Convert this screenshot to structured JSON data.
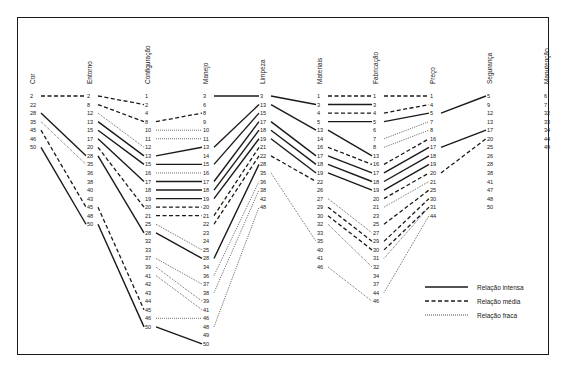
{
  "columns": [
    {
      "name": "Cor",
      "values": [
        "2",
        "22",
        "28",
        "35",
        "45",
        "46",
        "50"
      ]
    },
    {
      "name": "Entorno",
      "values": [
        "2",
        "8",
        "12",
        "13",
        "15",
        "17",
        "20",
        "28",
        "35",
        "36",
        "38",
        "40",
        "43",
        "45",
        "48",
        "50"
      ]
    },
    {
      "name": "Configuração",
      "values": [
        "1",
        "2",
        "4",
        "8",
        "10",
        "11",
        "12",
        "13",
        "15",
        "16",
        "17",
        "18",
        "19",
        "20",
        "21",
        "25",
        "28",
        "32",
        "33",
        "37",
        "39",
        "41",
        "42",
        "43",
        "44",
        "45",
        "46",
        "50"
      ]
    },
    {
      "name": "Manejo",
      "values": [
        "3",
        "6",
        "8",
        "9",
        "10",
        "11",
        "13",
        "14",
        "15",
        "16",
        "17",
        "18",
        "19",
        "20",
        "21",
        "22",
        "23",
        "24",
        "25",
        "28",
        "34",
        "36",
        "37",
        "38",
        "39",
        "41",
        "46",
        "48",
        "49",
        "50"
      ]
    },
    {
      "name": "Limpeza",
      "values": [
        "3",
        "13",
        "15",
        "17",
        "18",
        "19",
        "21",
        "22",
        "28",
        "35",
        "36",
        "38",
        "42",
        "48"
      ]
    },
    {
      "name": "Materiais",
      "values": [
        "1",
        "3",
        "4",
        "5",
        "13",
        "14",
        "16",
        "17",
        "18",
        "19",
        "22",
        "26",
        "27",
        "29",
        "30",
        "32",
        "33",
        "35",
        "40",
        "41",
        "46"
      ]
    },
    {
      "name": "Fabricação",
      "values": [
        "1",
        "3",
        "4",
        "5",
        "6",
        "7",
        "8",
        "13",
        "16",
        "17",
        "18",
        "19",
        "20",
        "21",
        "23",
        "25",
        "27",
        "29",
        "30",
        "31",
        "32",
        "34",
        "37",
        "44",
        "46"
      ]
    },
    {
      "name": "Preço",
      "values": [
        "1",
        "4",
        "5",
        "7",
        "8",
        "16",
        "17",
        "18",
        "19",
        "20",
        "21",
        "25",
        "30",
        "31",
        "44"
      ]
    },
    {
      "name": "Segurança",
      "values": [
        "5",
        "9",
        "12",
        "13",
        "17",
        "20",
        "25",
        "26",
        "28",
        "38",
        "41",
        "47",
        "48",
        "50"
      ]
    },
    {
      "name": "Manutenção",
      "values": [
        "6",
        "7",
        "32",
        "33",
        "34",
        "44",
        "49"
      ]
    }
  ],
  "links": [
    {
      "from": [
        0,
        "2"
      ],
      "to": [
        1,
        "2"
      ],
      "type": "medium"
    },
    {
      "from": [
        0,
        "28"
      ],
      "to": [
        1,
        "28"
      ],
      "type": "strong"
    },
    {
      "from": [
        0,
        "35"
      ],
      "to": [
        1,
        "35"
      ],
      "type": "weak"
    },
    {
      "from": [
        0,
        "45"
      ],
      "to": [
        1,
        "45"
      ],
      "type": "medium"
    },
    {
      "from": [
        0,
        "50"
      ],
      "to": [
        1,
        "50"
      ],
      "type": "strong"
    },
    {
      "from": [
        1,
        "2"
      ],
      "to": [
        2,
        "2"
      ],
      "type": "medium"
    },
    {
      "from": [
        1,
        "8"
      ],
      "to": [
        2,
        "8"
      ],
      "type": "medium"
    },
    {
      "from": [
        1,
        "12"
      ],
      "to": [
        2,
        "12"
      ],
      "type": "weak"
    },
    {
      "from": [
        1,
        "13"
      ],
      "to": [
        2,
        "13"
      ],
      "type": "strong"
    },
    {
      "from": [
        1,
        "15"
      ],
      "to": [
        2,
        "15"
      ],
      "type": "strong"
    },
    {
      "from": [
        1,
        "17"
      ],
      "to": [
        2,
        "17"
      ],
      "type": "strong"
    },
    {
      "from": [
        1,
        "20"
      ],
      "to": [
        2,
        "20"
      ],
      "type": "medium"
    },
    {
      "from": [
        1,
        "28"
      ],
      "to": [
        2,
        "28"
      ],
      "type": "strong"
    },
    {
      "from": [
        1,
        "45"
      ],
      "to": [
        2,
        "45"
      ],
      "type": "medium"
    },
    {
      "from": [
        1,
        "50"
      ],
      "to": [
        2,
        "50"
      ],
      "type": "strong"
    },
    {
      "from": [
        2,
        "8"
      ],
      "to": [
        3,
        "8"
      ],
      "type": "medium"
    },
    {
      "from": [
        2,
        "10"
      ],
      "to": [
        3,
        "10"
      ],
      "type": "weak"
    },
    {
      "from": [
        2,
        "11"
      ],
      "to": [
        3,
        "11"
      ],
      "type": "weak"
    },
    {
      "from": [
        2,
        "13"
      ],
      "to": [
        3,
        "13"
      ],
      "type": "strong"
    },
    {
      "from": [
        2,
        "15"
      ],
      "to": [
        3,
        "15"
      ],
      "type": "strong"
    },
    {
      "from": [
        2,
        "16"
      ],
      "to": [
        3,
        "16"
      ],
      "type": "weak"
    },
    {
      "from": [
        2,
        "17"
      ],
      "to": [
        3,
        "17"
      ],
      "type": "strong"
    },
    {
      "from": [
        2,
        "18"
      ],
      "to": [
        3,
        "18"
      ],
      "type": "strong"
    },
    {
      "from": [
        2,
        "19"
      ],
      "to": [
        3,
        "19"
      ],
      "type": "strong"
    },
    {
      "from": [
        2,
        "20"
      ],
      "to": [
        3,
        "20"
      ],
      "type": "medium"
    },
    {
      "from": [
        2,
        "21"
      ],
      "to": [
        3,
        "21"
      ],
      "type": "medium"
    },
    {
      "from": [
        2,
        "25"
      ],
      "to": [
        3,
        "25"
      ],
      "type": "weak"
    },
    {
      "from": [
        2,
        "28"
      ],
      "to": [
        3,
        "28"
      ],
      "type": "strong"
    },
    {
      "from": [
        2,
        "37"
      ],
      "to": [
        3,
        "37"
      ],
      "type": "weak"
    },
    {
      "from": [
        2,
        "39"
      ],
      "to": [
        3,
        "39"
      ],
      "type": "weak"
    },
    {
      "from": [
        2,
        "41"
      ],
      "to": [
        3,
        "41"
      ],
      "type": "weak"
    },
    {
      "from": [
        2,
        "46"
      ],
      "to": [
        3,
        "46"
      ],
      "type": "weak"
    },
    {
      "from": [
        2,
        "50"
      ],
      "to": [
        3,
        "50"
      ],
      "type": "strong"
    },
    {
      "from": [
        3,
        "3"
      ],
      "to": [
        4,
        "3"
      ],
      "type": "strong"
    },
    {
      "from": [
        3,
        "13"
      ],
      "to": [
        4,
        "13"
      ],
      "type": "strong"
    },
    {
      "from": [
        3,
        "15"
      ],
      "to": [
        4,
        "15"
      ],
      "type": "strong"
    },
    {
      "from": [
        3,
        "17"
      ],
      "to": [
        4,
        "17"
      ],
      "type": "strong"
    },
    {
      "from": [
        3,
        "18"
      ],
      "to": [
        4,
        "18"
      ],
      "type": "strong"
    },
    {
      "from": [
        3,
        "19"
      ],
      "to": [
        4,
        "19"
      ],
      "type": "strong"
    },
    {
      "from": [
        3,
        "21"
      ],
      "to": [
        4,
        "21"
      ],
      "type": "medium"
    },
    {
      "from": [
        3,
        "22"
      ],
      "to": [
        4,
        "22"
      ],
      "type": "medium"
    },
    {
      "from": [
        3,
        "28"
      ],
      "to": [
        4,
        "28"
      ],
      "type": "strong"
    },
    {
      "from": [
        3,
        "36"
      ],
      "to": [
        4,
        "36"
      ],
      "type": "weak"
    },
    {
      "from": [
        3,
        "38"
      ],
      "to": [
        4,
        "38"
      ],
      "type": "weak"
    },
    {
      "from": [
        3,
        "48"
      ],
      "to": [
        4,
        "48"
      ],
      "type": "weak"
    },
    {
      "from": [
        4,
        "3"
      ],
      "to": [
        5,
        "3"
      ],
      "type": "strong"
    },
    {
      "from": [
        4,
        "13"
      ],
      "to": [
        5,
        "13"
      ],
      "type": "strong"
    },
    {
      "from": [
        4,
        "17"
      ],
      "to": [
        5,
        "17"
      ],
      "type": "strong"
    },
    {
      "from": [
        4,
        "18"
      ],
      "to": [
        5,
        "18"
      ],
      "type": "strong"
    },
    {
      "from": [
        4,
        "19"
      ],
      "to": [
        5,
        "19"
      ],
      "type": "strong"
    },
    {
      "from": [
        4,
        "22"
      ],
      "to": [
        5,
        "22"
      ],
      "type": "medium"
    },
    {
      "from": [
        4,
        "35"
      ],
      "to": [
        5,
        "35"
      ],
      "type": "weak"
    },
    {
      "from": [
        5,
        "1"
      ],
      "to": [
        6,
        "1"
      ],
      "type": "medium"
    },
    {
      "from": [
        5,
        "3"
      ],
      "to": [
        6,
        "3"
      ],
      "type": "strong"
    },
    {
      "from": [
        5,
        "4"
      ],
      "to": [
        6,
        "4"
      ],
      "type": "medium"
    },
    {
      "from": [
        5,
        "5"
      ],
      "to": [
        6,
        "5"
      ],
      "type": "strong"
    },
    {
      "from": [
        5,
        "13"
      ],
      "to": [
        6,
        "13"
      ],
      "type": "strong"
    },
    {
      "from": [
        5,
        "16"
      ],
      "to": [
        6,
        "16"
      ],
      "type": "medium"
    },
    {
      "from": [
        5,
        "17"
      ],
      "to": [
        6,
        "17"
      ],
      "type": "strong"
    },
    {
      "from": [
        5,
        "18"
      ],
      "to": [
        6,
        "18"
      ],
      "type": "strong"
    },
    {
      "from": [
        5,
        "19"
      ],
      "to": [
        6,
        "19"
      ],
      "type": "strong"
    },
    {
      "from": [
        5,
        "27"
      ],
      "to": [
        6,
        "27"
      ],
      "type": "weak"
    },
    {
      "from": [
        5,
        "29"
      ],
      "to": [
        6,
        "29"
      ],
      "type": "medium"
    },
    {
      "from": [
        5,
        "30"
      ],
      "to": [
        6,
        "30"
      ],
      "type": "medium"
    },
    {
      "from": [
        5,
        "32"
      ],
      "to": [
        6,
        "32"
      ],
      "type": "weak"
    },
    {
      "from": [
        5,
        "46"
      ],
      "to": [
        6,
        "46"
      ],
      "type": "weak"
    },
    {
      "from": [
        6,
        "1"
      ],
      "to": [
        7,
        "1"
      ],
      "type": "medium"
    },
    {
      "from": [
        6,
        "4"
      ],
      "to": [
        7,
        "4"
      ],
      "type": "medium"
    },
    {
      "from": [
        6,
        "5"
      ],
      "to": [
        7,
        "5"
      ],
      "type": "strong"
    },
    {
      "from": [
        6,
        "7"
      ],
      "to": [
        7,
        "7"
      ],
      "type": "weak"
    },
    {
      "from": [
        6,
        "8"
      ],
      "to": [
        7,
        "8"
      ],
      "type": "weak"
    },
    {
      "from": [
        6,
        "16"
      ],
      "to": [
        7,
        "16"
      ],
      "type": "medium"
    },
    {
      "from": [
        6,
        "17"
      ],
      "to": [
        7,
        "17"
      ],
      "type": "strong"
    },
    {
      "from": [
        6,
        "18"
      ],
      "to": [
        7,
        "18"
      ],
      "type": "strong"
    },
    {
      "from": [
        6,
        "19"
      ],
      "to": [
        7,
        "19"
      ],
      "type": "strong"
    },
    {
      "from": [
        6,
        "20"
      ],
      "to": [
        7,
        "20"
      ],
      "type": "medium"
    },
    {
      "from": [
        6,
        "21"
      ],
      "to": [
        7,
        "21"
      ],
      "type": "weak"
    },
    {
      "from": [
        6,
        "25"
      ],
      "to": [
        7,
        "25"
      ],
      "type": "medium"
    },
    {
      "from": [
        6,
        "29"
      ],
      "to": [
        7,
        "30"
      ],
      "type": "medium"
    },
    {
      "from": [
        6,
        "30"
      ],
      "to": [
        7,
        "31"
      ],
      "type": "medium"
    },
    {
      "from": [
        6,
        "31"
      ],
      "to": [
        7,
        "31"
      ],
      "type": "weak"
    },
    {
      "from": [
        6,
        "44"
      ],
      "to": [
        7,
        "44"
      ],
      "type": "weak"
    },
    {
      "from": [
        7,
        "5"
      ],
      "to": [
        8,
        "5"
      ],
      "type": "strong"
    },
    {
      "from": [
        7,
        "17"
      ],
      "to": [
        8,
        "17"
      ],
      "type": "strong"
    },
    {
      "from": [
        7,
        "20"
      ],
      "to": [
        8,
        "20"
      ],
      "type": "medium"
    }
  ],
  "legend": [
    {
      "type": "strong",
      "label": "Relação intensa"
    },
    {
      "type": "medium",
      "label": "Relação média"
    },
    {
      "type": "weak",
      "label": "Relação fraca"
    }
  ],
  "colors": {
    "line": "#1a1a1a",
    "text": "#222222",
    "background": "#ffffff"
  }
}
